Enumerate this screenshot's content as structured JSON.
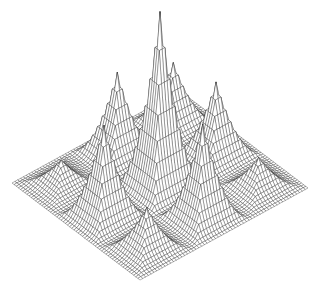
{
  "chart_data": {
    "type": "surface-wireframe",
    "title": "",
    "xlabel": "",
    "ylabel": "",
    "zlabel": "",
    "grid": false,
    "legend": null,
    "mesh_resolution": 60,
    "colors": {
      "line": "#222222",
      "background": "#ffffff"
    },
    "projection": {
      "left_corner": [
        12,
        183
      ],
      "back_corner": [
        180,
        91
      ],
      "front_corner": [
        140,
        280
      ]
    },
    "peak_positions_uv": [
      1,
      3,
      5
    ],
    "peaks": [
      {
        "u": 0.1667,
        "v": 0.1667,
        "height": 24
      },
      {
        "u": 0.5,
        "v": 0.1667,
        "height": 81
      },
      {
        "u": 0.8333,
        "v": 0.1667,
        "height": 60
      },
      {
        "u": 0.1667,
        "v": 0.5,
        "height": 91
      },
      {
        "u": 0.5,
        "v": 0.5,
        "height": 174
      },
      {
        "u": 0.8333,
        "v": 0.5,
        "height": 73
      },
      {
        "u": 0.1667,
        "v": 0.8333,
        "height": 41
      },
      {
        "u": 0.5,
        "v": 0.8333,
        "height": 94
      },
      {
        "u": 0.8333,
        "v": 0.8333,
        "height": 30
      }
    ]
  }
}
